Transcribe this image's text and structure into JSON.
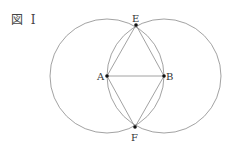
{
  "figure": {
    "label": "図 I"
  },
  "points": {
    "A": {
      "label": "A",
      "x": 107,
      "y": 76
    },
    "B": {
      "label": "B",
      "x": 164,
      "y": 76
    },
    "E": {
      "label": "E",
      "x": 136,
      "y": 25
    },
    "F": {
      "label": "F",
      "x": 135,
      "y": 127
    }
  },
  "circles": [
    {
      "center": "A",
      "radius": 57
    },
    {
      "center": "B",
      "radius": 57
    }
  ],
  "segments": [
    "AB",
    "AE",
    "BE",
    "AF",
    "BF"
  ],
  "colors": {
    "line": "#888888",
    "point": "#111111"
  }
}
